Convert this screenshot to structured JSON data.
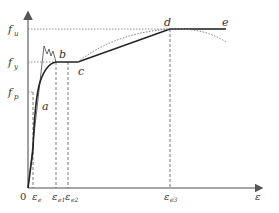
{
  "diagram": {
    "type": "stress-strain curve",
    "axes": {
      "origin_label": "0",
      "x_label": "ε",
      "y_tick_labels": {
        "fu": {
          "base": "f",
          "sub": "u"
        },
        "fy": {
          "base": "f",
          "sub": "y"
        },
        "fp": {
          "base": "f",
          "sub": "p"
        }
      },
      "x_tick_labels": {
        "ee": {
          "base": "ε",
          "sub": "e"
        },
        "ee1": {
          "base": "ε",
          "sub": "e1"
        },
        "ee2": {
          "base": "ε",
          "sub": "e2"
        },
        "ee3": {
          "base": "ε",
          "sub": "e3"
        }
      }
    },
    "points": {
      "a": "a",
      "b": "b",
      "c": "c",
      "d": "d",
      "e": "e"
    },
    "colors": {
      "axis": "#888888",
      "curve": "#222222",
      "dotted": "#777777",
      "dashed": "#555555"
    }
  }
}
